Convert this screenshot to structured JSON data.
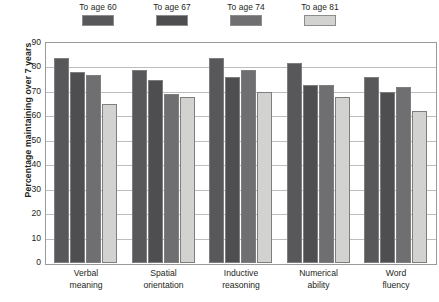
{
  "chart_data": {
    "type": "bar",
    "title": "",
    "xlabel": "",
    "ylabel": "Percentage maintaining over 7 years",
    "ylim": [
      0,
      90
    ],
    "yticks": [
      90,
      80,
      70,
      60,
      50,
      40,
      30,
      20,
      10,
      0
    ],
    "grid": true,
    "legend_position": "top",
    "categories": [
      "Verbal meaning",
      "Spatial orientation",
      "Inductive reasoning",
      "Numerical ability",
      "Word fluency"
    ],
    "category_lines": [
      [
        "Verbal",
        "meaning"
      ],
      [
        "Spatial",
        "orientation"
      ],
      [
        "Inductive",
        "reasoning"
      ],
      [
        "Numerical",
        "ability"
      ],
      [
        "Word",
        "fluency"
      ]
    ],
    "series": [
      {
        "name": "To age 60",
        "color": "#58585a",
        "values": [
          84,
          79,
          84,
          82,
          76
        ]
      },
      {
        "name": "To age 67",
        "color": "#4e4e50",
        "values": [
          78,
          75,
          76,
          73,
          70
        ]
      },
      {
        "name": "To age 74",
        "color": "#6f6f72",
        "values": [
          77,
          69,
          79,
          73,
          72
        ]
      },
      {
        "name": "To age 81",
        "color": "#d2d2d0",
        "values": [
          65,
          68,
          70,
          68,
          62
        ]
      }
    ]
  },
  "legend": {
    "items": [
      {
        "label": "To age 60",
        "color": "#58585a"
      },
      {
        "label": "To age 67",
        "color": "#4e4e50"
      },
      {
        "label": "To age 74",
        "color": "#6f6f72"
      },
      {
        "label": "To age 81",
        "color": "#d2d2d0"
      }
    ]
  }
}
